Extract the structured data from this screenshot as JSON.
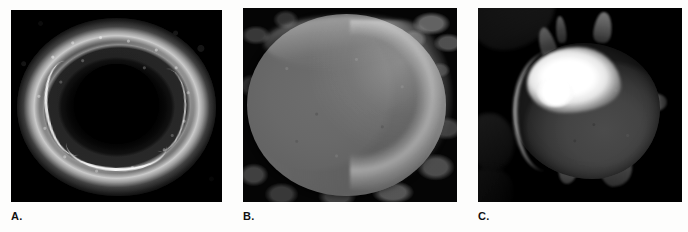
{
  "figure": {
    "background_color": "#fdfdfc",
    "panel_count": 3,
    "image_type": "scanning-electron-micrograph",
    "panels": [
      {
        "id": "A",
        "caption": "A.",
        "morphology": "discocyte",
        "description": "Dark SEM micrograph of a biconcave disc-shaped erythrocyte viewed face-on, with a deeply shadowed central depression ringed by a bright, coarsely speckled torus of membrane.",
        "dominant_colors": [
          "#030303",
          "#2e2e2e",
          "#d8d8d8"
        ],
        "frame": {
          "x": 11,
          "y": 10,
          "width": 211,
          "height": 192
        }
      },
      {
        "id": "B",
        "caption": "B.",
        "morphology": "spherocyte",
        "description": "Smooth, nearly featureless sphere filling most of the frame; mid-grey body graded to a brilliant white crescent along the upper-right rim, set against a dark background scattered with pale granular debris.",
        "dominant_colors": [
          "#0a0a0a",
          "#6a6a6a",
          "#f2f2f2"
        ],
        "frame": {
          "x": 243,
          "y": 8,
          "width": 214,
          "height": 194
        }
      },
      {
        "id": "C",
        "caption": "C.",
        "morphology": "echinocyte",
        "description": "Irregular cell bearing several blunt spicule projections at the top and sides, with an intense white highlight over the upper-left shoulder and a dark grey body, isolated on a black field.",
        "dominant_colors": [
          "#020202",
          "#464646",
          "#ffffff"
        ],
        "frame": {
          "x": 478,
          "y": 8,
          "width": 204,
          "height": 194
        }
      }
    ]
  }
}
